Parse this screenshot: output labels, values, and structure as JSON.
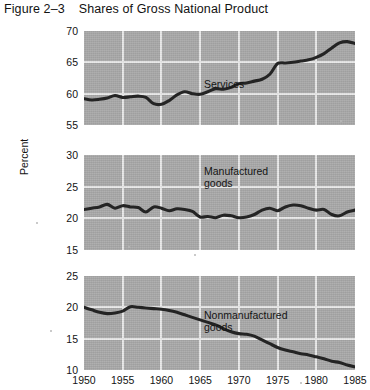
{
  "figure": {
    "number": "Figure 2–3",
    "title": "Shares of Gross National Product",
    "ylabel": "Percent"
  },
  "chart_data": {
    "type": "line",
    "title": "Shares of Gross National Product",
    "xlabel": "",
    "ylabel": "Percent",
    "grid": true,
    "legend_position": "inline-annotation",
    "x": [
      1950,
      1951,
      1952,
      1953,
      1954,
      1955,
      1956,
      1957,
      1958,
      1959,
      1960,
      1961,
      1962,
      1963,
      1964,
      1965,
      1966,
      1967,
      1968,
      1969,
      1970,
      1971,
      1972,
      1973,
      1974,
      1975,
      1976,
      1977,
      1978,
      1979,
      1980,
      1981,
      1982,
      1983,
      1984,
      1985
    ],
    "xlim": [
      1950,
      1985
    ],
    "xticks": [
      1950,
      1955,
      1960,
      1965,
      1970,
      1975,
      1980,
      1985
    ],
    "panels": [
      {
        "name": "Services",
        "label": "Services",
        "ylim": [
          55,
          70
        ],
        "yticks": [
          55,
          60,
          65,
          70
        ],
        "values": [
          59.2,
          59.0,
          59.1,
          59.3,
          59.7,
          59.4,
          59.5,
          59.6,
          59.4,
          58.4,
          58.3,
          58.9,
          59.8,
          60.3,
          60.0,
          59.9,
          60.3,
          60.8,
          60.7,
          61.0,
          61.6,
          61.7,
          62.0,
          62.3,
          63.1,
          64.8,
          64.9,
          65.0,
          65.2,
          65.4,
          65.8,
          66.4,
          67.3,
          68.1,
          68.3,
          68.0
        ]
      },
      {
        "name": "Manufactured goods",
        "label": "Manufactured\ngoods",
        "ylim": [
          15,
          30
        ],
        "yticks": [
          15,
          20,
          25,
          30
        ],
        "values": [
          21.4,
          21.6,
          21.8,
          22.2,
          21.6,
          22.0,
          21.8,
          21.7,
          21.0,
          21.8,
          21.6,
          21.2,
          21.5,
          21.4,
          21.1,
          20.2,
          20.3,
          20.1,
          20.5,
          20.4,
          20.1,
          20.2,
          20.6,
          21.3,
          21.6,
          21.2,
          21.8,
          22.1,
          22.0,
          21.6,
          21.3,
          21.4,
          20.6,
          20.4,
          21.0,
          21.3
        ]
      },
      {
        "name": "Nonmanufactured goods",
        "label": "Nonmanufactured\ngoods",
        "ylim": [
          10,
          25
        ],
        "yticks": [
          10,
          15,
          20,
          25
        ],
        "values": [
          20.0,
          19.6,
          19.2,
          19.0,
          19.1,
          19.4,
          20.1,
          20.0,
          19.9,
          19.8,
          19.7,
          19.5,
          19.2,
          18.8,
          18.4,
          18.0,
          17.6,
          17.2,
          16.6,
          16.1,
          15.8,
          15.7,
          15.4,
          14.8,
          14.2,
          13.6,
          13.2,
          12.9,
          12.6,
          12.4,
          12.1,
          11.8,
          11.4,
          11.2,
          10.8,
          10.5
        ]
      }
    ]
  }
}
